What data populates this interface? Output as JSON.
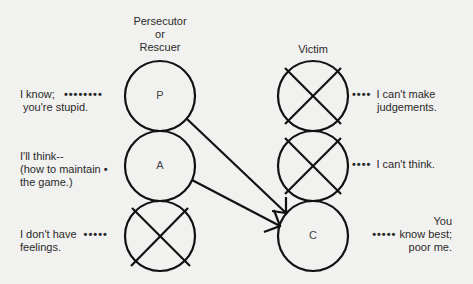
{
  "colors": {
    "background": "#f1f1ef",
    "ink": "#111111",
    "text": "#2a2a2a"
  },
  "headers": {
    "left_line1": "Persecutor",
    "left_line2": "or",
    "left_line3": "Rescuer",
    "right": "Victim"
  },
  "left_column": {
    "circles": [
      {
        "label": "P",
        "crossed": false
      },
      {
        "label": "A",
        "crossed": false
      },
      {
        "label": "",
        "crossed": true
      }
    ],
    "annotations": [
      {
        "line1": "I know;",
        "line2": "you're stupid.",
        "dots": "••••••••"
      },
      {
        "line1": "I'll think--",
        "line2": "(how to maintain",
        "line3": "the game.)",
        "dots": "•"
      },
      {
        "line1": "I don't have",
        "line2": "feelings.",
        "dots": "•••••"
      }
    ]
  },
  "right_column": {
    "circles": [
      {
        "label": "",
        "crossed": true
      },
      {
        "label": "",
        "crossed": true
      },
      {
        "label": "C",
        "crossed": false
      }
    ],
    "annotations": [
      {
        "line1": "I can't make",
        "line2": "judgements.",
        "dots": "••••"
      },
      {
        "line1": "I can't think.",
        "dots": "••••"
      },
      {
        "line1": "You",
        "line2": "know best;",
        "line3": "poor me.",
        "dots": "•••••"
      }
    ]
  },
  "arrows": [
    {
      "from": "P",
      "to": "C"
    },
    {
      "from": "A",
      "to": "C"
    }
  ]
}
